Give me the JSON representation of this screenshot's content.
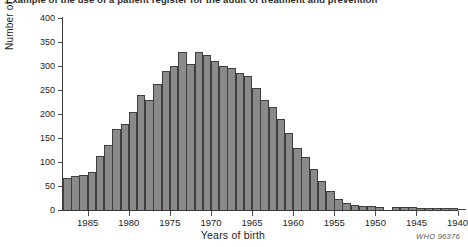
{
  "document": {
    "title": "Example of the use of a patient register for the audit of treatment and prevention"
  },
  "credit": "WHO 96376",
  "chart_data": {
    "type": "bar",
    "title": "",
    "subtitle": "",
    "xlabel": "Years of birth",
    "ylabel": "Number of patients",
    "ylim": [
      0,
      400
    ],
    "ytick_values": [
      0,
      50,
      100,
      150,
      200,
      250,
      300,
      350,
      400
    ],
    "ytick_labels": [
      "0",
      "50",
      "100",
      "150",
      "200",
      "250",
      "300",
      "350",
      "400"
    ],
    "xtick_values": [
      1985,
      1980,
      1975,
      1970,
      1965,
      1960,
      1955,
      1950,
      1945,
      1940
    ],
    "xtick_labels": [
      "1985",
      "1980",
      "1975",
      "1970",
      "1965",
      "1960",
      "1955",
      "1950",
      "1945",
      "1940"
    ],
    "x_axis_direction": "descending",
    "grid": false,
    "legend": false,
    "bar_color": "#8a8a8a",
    "bar_edge_color": "#3f3f3f",
    "categories": [
      1988,
      1987,
      1986,
      1985,
      1984,
      1983,
      1982,
      1981,
      1980,
      1979,
      1978,
      1977,
      1976,
      1975,
      1974,
      1973,
      1972,
      1971,
      1970,
      1969,
      1968,
      1967,
      1966,
      1965,
      1964,
      1963,
      1962,
      1961,
      1960,
      1959,
      1958,
      1957,
      1956,
      1955,
      1954,
      1953,
      1952,
      1951,
      1950,
      1949,
      1948,
      1947,
      1946,
      1945,
      1944,
      1943,
      1942,
      1941,
      1940
    ],
    "values": [
      67,
      70,
      72,
      80,
      112,
      135,
      168,
      180,
      205,
      240,
      230,
      262,
      290,
      300,
      330,
      305,
      330,
      322,
      310,
      300,
      295,
      285,
      280,
      255,
      230,
      215,
      190,
      160,
      130,
      110,
      85,
      60,
      40,
      22,
      14,
      10,
      9,
      8,
      6,
      0,
      6,
      6,
      6,
      5,
      5,
      5,
      4,
      4,
      3
    ]
  }
}
